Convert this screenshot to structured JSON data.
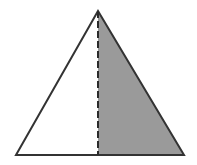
{
  "figure": {
    "title": "Triangle with shaded right half divided by a dashed altitude",
    "canvas": {
      "width": 197,
      "height": 165,
      "background_color": "#ffffff"
    },
    "colors": {
      "outline": "#333333",
      "shaded_fill": "#9a9a9a",
      "unshaded_fill": "#ffffff",
      "dashed_line": "#2b2b2b"
    },
    "stroke_width": 2,
    "dash_pattern": "7 3",
    "vertices": {
      "apex_label": "apex",
      "apex": {
        "x": 98,
        "y": 11
      },
      "bottom_left_label": "bottom-left",
      "bottom_left": {
        "x": 16,
        "y": 155
      },
      "bottom_right_label": "bottom-right",
      "bottom_right": {
        "x": 184,
        "y": 155
      },
      "base_midpoint_label": "base-midpoint",
      "base_midpoint": {
        "x": 98,
        "y": 155
      }
    },
    "regions": [
      {
        "name": "left-half",
        "fill": "#ffffff",
        "shaded": "no",
        "points": "16,155 98,11 98,155"
      },
      {
        "name": "right-half",
        "fill": "#9a9a9a",
        "shaded": "yes",
        "points": "98,11 184,155 98,155"
      }
    ],
    "outline_points": "16,155 98,11 184,155",
    "altitude": {
      "name": "dashed-altitude",
      "x1": 98,
      "y1": 11,
      "x2": 98,
      "y2": 155,
      "style": "dashed"
    }
  }
}
